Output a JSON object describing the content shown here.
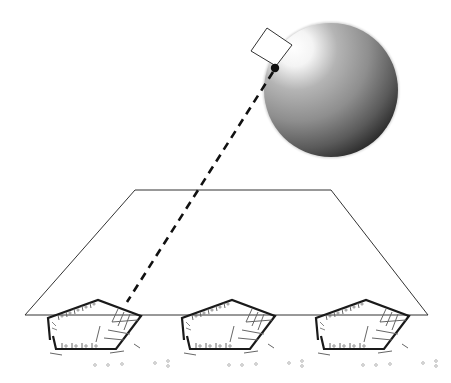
{
  "diagram": {
    "colors": {
      "background": "#ffffff",
      "line": "#222222",
      "plan_wall": "#1a1a1a",
      "plan_detail": "#666666",
      "sphere_highlight": "#ffffff",
      "sphere_mid": "#9a9a9a",
      "sphere_shadow": "#3c3c3c"
    },
    "elements": {
      "sphere": {
        "label": ""
      },
      "viewpoint_square": {
        "label": ""
      },
      "viewpoint_dot": {
        "label": ""
      },
      "sightline": {
        "style": "dashed"
      },
      "ground_plane": {
        "shape": "trapezoid"
      },
      "floor_plans": [
        {
          "id": "plan-1",
          "label": ""
        },
        {
          "id": "plan-2",
          "label": ""
        },
        {
          "id": "plan-3",
          "label": ""
        }
      ]
    }
  }
}
